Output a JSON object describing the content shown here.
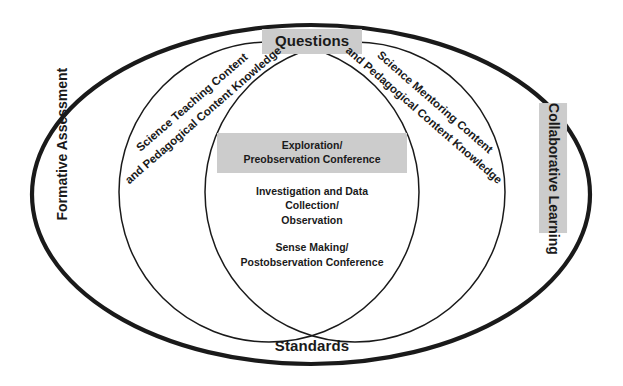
{
  "diagram": {
    "type": "venn",
    "outer_label_top": "Questions",
    "outer_label_bottom": "Standards",
    "outer_label_left": "Formative Assessment",
    "outer_label_right": "Collaborative Learning",
    "left_circle_title_line1": "Science Teaching Content",
    "left_circle_title_line2": "and Pedagogical Content Knowledge",
    "right_circle_title_line1": "Science Mentoring Content",
    "right_circle_title_line2": "and Pedagogical Content Knowledge",
    "intersection": {
      "item1_line1": "Exploration/",
      "item1_line2": "Preobservation Conference",
      "item2_line1": "Investigation and Data Collection/",
      "item2_line2": "Observation",
      "item3_line1": "Sense Making/",
      "item3_line2": "Postobservation Conference"
    },
    "colors": {
      "stroke": "#1a1a1a",
      "highlight_background": "#cccccc",
      "canvas_background": "#ffffff",
      "text": "#1a1a1a"
    }
  }
}
